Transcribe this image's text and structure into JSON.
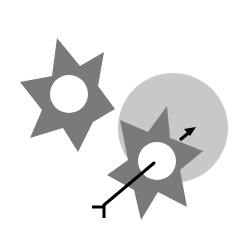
{
  "diagram": {
    "colors": {
      "background": "#ffffff",
      "star": "#7a7a7a",
      "circle": "#c8c8c8",
      "hole": "#ffffff",
      "line": "#000000"
    },
    "circle": {
      "cx": 173,
      "cy": 128,
      "r": 55
    },
    "stars": [
      {
        "name": "star-left",
        "points": "57,38 80,66 104,52 98,86 115,109 93,122 78,152 63,128 30,138 42,110 20,82 52,76",
        "hole": {
          "cx": 69,
          "cy": 94,
          "r": 19
        }
      },
      {
        "name": "star-right",
        "points": "167,106 170,138 203,151 180,170 187,207 158,192 141,220 134,190 107,175 128,160 120,120 148,132",
        "hole": {
          "cx": 157,
          "cy": 161,
          "r": 19
        }
      }
    ],
    "antibody": {
      "shaft": {
        "x1": 154,
        "y1": 163,
        "x2": 104,
        "y2": 205
      },
      "fork_h": {
        "x1": 92,
        "y1": 207,
        "x2": 104,
        "y2": 207
      },
      "fork_v": {
        "x1": 104,
        "y1": 205,
        "x2": 104,
        "y2": 218
      }
    },
    "arrow": {
      "x1": 180,
      "y1": 140,
      "x2": 192,
      "y2": 130,
      "head": "196,127 184,129 190,136"
    }
  }
}
